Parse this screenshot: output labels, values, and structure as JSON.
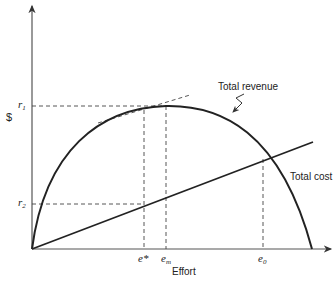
{
  "diagram": {
    "y_axis_label": "$",
    "x_axis_label": "Effort",
    "curves": {
      "revenue_label": "Total revenue",
      "cost_label": "Total cost"
    },
    "y_ticks": {
      "r1": "r",
      "r1_sub": "1",
      "r2": "r",
      "r2_sub": "2"
    },
    "x_ticks": {
      "e_star": "e*",
      "e_m": "e",
      "e_m_sub": "m",
      "e_0": "e",
      "e_0_sub": "0"
    },
    "colors": {
      "line": "#222222",
      "dashed": "#444444"
    }
  }
}
